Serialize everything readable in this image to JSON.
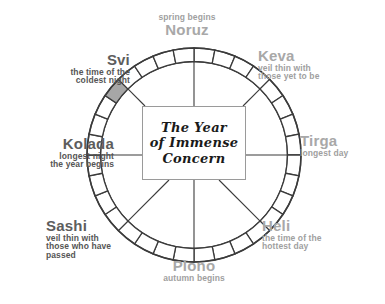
{
  "diagram": {
    "title_lines": [
      "The Year",
      "of Immense",
      "Concern"
    ],
    "wheel": {
      "cell_count": 32,
      "highlighted_cell_index": 27,
      "ring_stroke": "#3b3b3b",
      "cell_fill": "#ffffff",
      "highlight_fill": "#a6a6a6",
      "spoke_count": 8
    },
    "markers": [
      {
        "id": "noruz",
        "name": "Noruz",
        "desc": "spring begins",
        "sub": "",
        "angle_deg": 0,
        "align": "center",
        "desc_above": true
      },
      {
        "id": "keva",
        "name": "Keva",
        "desc": "veil thin with",
        "sub": "those yet to be",
        "angle_deg": 45,
        "align": "left",
        "desc_above": false
      },
      {
        "id": "tirga",
        "name": "Tirga",
        "desc": "longest day",
        "sub": "",
        "angle_deg": 90,
        "align": "left",
        "desc_above": false
      },
      {
        "id": "heli",
        "name": "Heli",
        "desc": "the time of the",
        "sub": "hottest day",
        "angle_deg": 135,
        "align": "left",
        "desc_above": false
      },
      {
        "id": "plono",
        "name": "Plono",
        "desc": "autumn begins",
        "sub": "",
        "angle_deg": 180,
        "align": "center",
        "desc_above": false
      },
      {
        "id": "sashi",
        "name": "Sashi",
        "desc": "veil thin with",
        "sub": "those who have",
        "sub2": "passed",
        "angle_deg": 225,
        "align": "left",
        "desc_above": false
      },
      {
        "id": "kolada",
        "name": "Kolada",
        "desc": "longest night",
        "sub": "the year begins",
        "angle_deg": 270,
        "align": "right",
        "desc_above": false
      },
      {
        "id": "svi",
        "name": "Svi",
        "desc": "the time of the",
        "sub": "coldest night",
        "angle_deg": 315,
        "align": "right",
        "desc_above": false
      }
    ]
  }
}
